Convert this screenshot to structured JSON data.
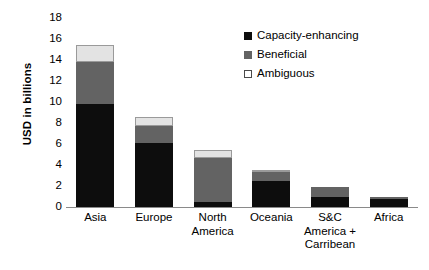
{
  "chart_data": {
    "type": "bar",
    "subtype": "stacked-bar",
    "title": "",
    "xlabel": "",
    "ylabel": "USD in billions",
    "ylim": [
      0,
      18
    ],
    "ytick_step": 2,
    "yticks": [
      18,
      16,
      14,
      12,
      10,
      8,
      6,
      4,
      2,
      0
    ],
    "grid": false,
    "legend_position": "top-right",
    "categories": [
      "Asia",
      "Europe",
      "North America",
      "Oceania",
      "S&C America + Carribean",
      "Africa"
    ],
    "category_lines": [
      [
        "Asia"
      ],
      [
        "Europe"
      ],
      [
        "North",
        "America"
      ],
      [
        "Oceania"
      ],
      [
        "S&C",
        "America +",
        "Carribean"
      ],
      [
        "Africa"
      ]
    ],
    "series": [
      {
        "name": "Capacity-enhancing",
        "color": "#0d0d0d",
        "values": [
          9.8,
          6.1,
          0.5,
          2.5,
          1.0,
          0.8
        ]
      },
      {
        "name": "Beneficial",
        "color": "#636363",
        "values": [
          4.0,
          1.6,
          4.2,
          0.85,
          0.9,
          0.1
        ]
      },
      {
        "name": "Ambiguous",
        "color": "#e3e3e3",
        "values": [
          1.6,
          0.9,
          0.7,
          0.05,
          0.0,
          0.0
        ]
      }
    ],
    "totals": [
      15.4,
      8.6,
      5.4,
      3.4,
      1.9,
      0.9
    ]
  },
  "legend": {
    "items": [
      {
        "label": "Capacity-enhancing",
        "swatch": "legend-swatch-black"
      },
      {
        "label": "Beneficial",
        "swatch": "legend-swatch-gray"
      },
      {
        "label": "Ambiguous",
        "swatch": "legend-swatch-white"
      }
    ]
  }
}
